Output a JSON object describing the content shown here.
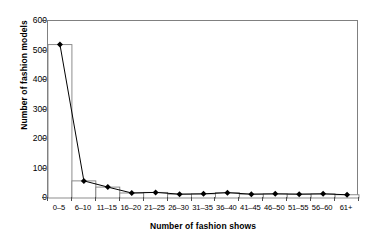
{
  "chart_data": {
    "type": "bar",
    "title": "",
    "xlabel": "Number of fashion shows",
    "ylabel": "Number of fashion models",
    "categories": [
      "0–5",
      "6–10",
      "11–15",
      "16–20",
      "21–25",
      "26–30",
      "31–35",
      "36–40",
      "41–45",
      "46–50",
      "51–55",
      "56–60",
      "61+"
    ],
    "values": [
      520,
      58,
      37,
      17,
      19,
      13,
      14,
      18,
      13,
      14,
      13,
      14,
      11
    ],
    "series": [
      {
        "name": "Number of fashion models",
        "type": "bar+line-markers",
        "values": [
          520,
          58,
          37,
          17,
          19,
          13,
          14,
          18,
          13,
          14,
          13,
          14,
          11
        ]
      }
    ],
    "ylim": [
      0,
      600
    ],
    "yticks": [
      0,
      100,
      200,
      300,
      400,
      500,
      600
    ],
    "ytick_labels": [
      "0",
      "100",
      "200",
      "300",
      "400",
      "500",
      "600"
    ],
    "grid": false,
    "legend": false,
    "legend_position": "none",
    "marker": "filled-diamond",
    "bar_fill": "#ffffff",
    "bar_edge": "#808080",
    "line_color": "#000000",
    "frame": true
  },
  "colors": {
    "axis": "#808080",
    "tick": "#4d4d4d",
    "text": "#000000",
    "background": "#ffffff",
    "line": "#000000",
    "marker": "#000000"
  }
}
